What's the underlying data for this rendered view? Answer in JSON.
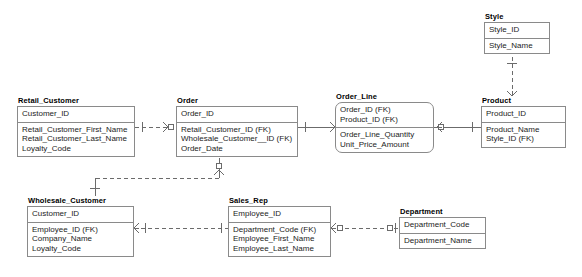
{
  "diagram": {
    "notation": "crow's foot (IDEF1X / information engineering)",
    "background_color": "#ffffff",
    "line_color": "#6b6b6b",
    "border_color": "#8a8a8a",
    "text_color": "#1c1c1c"
  },
  "entities": [
    {
      "id": "style",
      "name": "Style",
      "shape": "rectangle",
      "x": 484,
      "y": 12,
      "width": 66,
      "primary_keys": [
        "Style_ID"
      ],
      "attributes": [
        "Style_Name"
      ]
    },
    {
      "id": "retail_customer",
      "name": "Retail_Customer",
      "shape": "rectangle",
      "x": 17,
      "y": 96,
      "width": 118,
      "primary_keys": [
        "Customer_ID"
      ],
      "attributes": [
        "Retail_Customer_First_Name",
        "Retail_Customer_Last_Name",
        "Loyalty_Code"
      ]
    },
    {
      "id": "order",
      "name": "Order",
      "shape": "rectangle",
      "x": 176,
      "y": 96,
      "width": 122,
      "primary_keys": [
        "Order_ID"
      ],
      "attributes": [
        "Retail_Customer_ID (FK)",
        "Wholesale_Customer__ID (FK)",
        "Order_Date"
      ]
    },
    {
      "id": "order_line",
      "name": "Order_Line",
      "shape": "rounded-rectangle",
      "x": 335,
      "y": 92,
      "width": 99,
      "primary_keys": [
        "Order_ID (FK)",
        "Product_ID (FK)"
      ],
      "attributes": [
        "Order_Line_Quantity",
        "Unit_Price_Amount"
      ]
    },
    {
      "id": "product",
      "name": "Product",
      "shape": "rectangle",
      "x": 481,
      "y": 96,
      "width": 85,
      "primary_keys": [
        "Product_ID"
      ],
      "attributes": [
        "Product_Name",
        "Style_ID (FK)"
      ]
    },
    {
      "id": "wholesale_customer",
      "name": "Wholesale_Customer",
      "shape": "rectangle",
      "x": 27,
      "y": 196,
      "width": 107,
      "primary_keys": [
        "Customer_ID"
      ],
      "attributes": [
        "Employee_ID (FK)",
        "Company_Name",
        "Loyalty_Code"
      ]
    },
    {
      "id": "sales_rep",
      "name": "Sales_Rep",
      "shape": "rectangle",
      "x": 228,
      "y": 196,
      "width": 103,
      "primary_keys": [
        "Employee_ID"
      ],
      "attributes": [
        "Department_Code (FK)",
        "Employee_First_Name",
        "Employee_Last_Name"
      ]
    },
    {
      "id": "department",
      "name": "Department",
      "shape": "rectangle",
      "x": 399,
      "y": 207,
      "width": 87,
      "primary_keys": [
        "Department_Code"
      ],
      "attributes": [
        "Department_Name"
      ]
    }
  ],
  "relationships": [
    {
      "id": "rel-retail-order",
      "from": "retail_customer",
      "to": "order",
      "line_style": "dashed",
      "from_cardinality": "one",
      "to_cardinality": "zero-or-many"
    },
    {
      "id": "rel-order-orderline",
      "from": "order",
      "to": "order_line",
      "line_style": "solid",
      "from_cardinality": "one",
      "to_cardinality": "many"
    },
    {
      "id": "rel-orderline-product",
      "from": "order_line",
      "to": "product",
      "line_style": "solid",
      "from_cardinality": "zero-or-many",
      "to_cardinality": "one"
    },
    {
      "id": "rel-style-product",
      "from": "style",
      "to": "product",
      "line_style": "dashed",
      "from_cardinality": "one",
      "to_cardinality": "zero-or-many"
    },
    {
      "id": "rel-order-wholesale",
      "from": "order",
      "to": "wholesale_customer",
      "line_style": "dashed",
      "from_cardinality": "zero-or-many",
      "to_cardinality": "one"
    },
    {
      "id": "rel-wholesale-salesrep",
      "from": "wholesale_customer",
      "to": "sales_rep",
      "line_style": "dashed",
      "from_cardinality": "zero-or-many",
      "to_cardinality": "one"
    },
    {
      "id": "rel-salesrep-department",
      "from": "sales_rep",
      "to": "department",
      "line_style": "dashed",
      "from_cardinality": "zero-or-many",
      "to_cardinality": "zero-or-one"
    }
  ]
}
